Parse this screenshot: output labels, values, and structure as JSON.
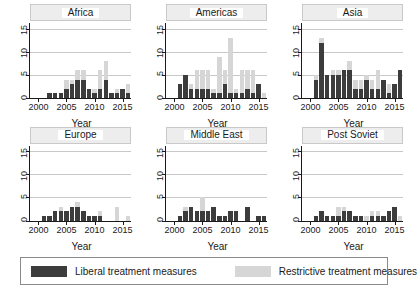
{
  "chart_data": {
    "type": "bar",
    "title": "",
    "subtitle": "",
    "xlabel": "Year",
    "ylabel": "",
    "stacked": true,
    "grid": true,
    "legend_position": "bottom",
    "ylim": [
      0,
      16.5
    ],
    "yticks": [
      0,
      5,
      10,
      15
    ],
    "ytick_labels": [
      "0",
      "5",
      "10",
      "15"
    ],
    "xticks": [
      2000,
      2005,
      2010,
      2015
    ],
    "xtick_labels": [
      "2000",
      "2005",
      "2010",
      "2015"
    ],
    "xlim": [
      1998.5,
      2016.5
    ],
    "x": [
      2000,
      2001,
      2002,
      2003,
      2004,
      2005,
      2006,
      2007,
      2008,
      2009,
      2010,
      2011,
      2012,
      2013,
      2014,
      2015,
      2016
    ],
    "series_names": [
      "Liberal treatment measures",
      "Restrictive treatment measures"
    ],
    "colors": {
      "liberal": "#3c3c3c",
      "restrictive": "#d6d6d6",
      "gridline": "#c8c8c8",
      "axis": "#1a1a1a",
      "strip_background": "#ededed",
      "background": "#ffffff"
    },
    "panels": [
      {
        "name": "Africa",
        "series": [
          {
            "name": "Liberal treatment measures",
            "values": [
              0,
              0,
              1,
              1,
              1,
              2,
              3,
              4,
              4,
              2,
              1,
              2,
              4,
              1,
              1,
              2,
              1,
              2,
              0
            ]
          },
          {
            "name": "Restrictive treatment measures",
            "values": [
              0,
              0,
              0,
              0,
              0,
              2,
              1,
              2,
              2,
              0,
              1,
              4,
              4,
              0,
              1,
              0,
              2,
              0,
              0
            ]
          }
        ]
      },
      {
        "name": "Americas",
        "series": [
          {
            "name": "Liberal treatment measures",
            "values": [
              0,
              3,
              5,
              2,
              2,
              2,
              2,
              1,
              1,
              3,
              1,
              1,
              1,
              2,
              1,
              3,
              0
            ]
          },
          {
            "name": "Restrictive treatment measures",
            "values": [
              0,
              0,
              0,
              1,
              4,
              4,
              4,
              1,
              8,
              3,
              12,
              1,
              5,
              4,
              5,
              0,
              1
            ]
          }
        ]
      },
      {
        "name": "Asia",
        "series": [
          {
            "name": "Liberal treatment measures",
            "values": [
              0,
              4,
              12,
              5,
              5,
              5,
              6,
              6,
              2,
              2,
              4,
              2,
              2,
              4,
              1,
              3,
              6
            ]
          },
          {
            "name": "Restrictive treatment measures",
            "values": [
              0,
              1,
              1,
              0,
              1,
              1,
              0,
              2,
              2,
              2,
              1,
              2,
              4,
              0,
              2,
              0,
              0
            ]
          }
        ]
      },
      {
        "name": "Europe",
        "series": [
          {
            "name": "Liberal treatment measures",
            "values": [
              0,
              1,
              1,
              2,
              2,
              2,
              3,
              3,
              2,
              1,
              1,
              1,
              0,
              0,
              0,
              0,
              0
            ]
          },
          {
            "name": "Restrictive treatment measures",
            "values": [
              0,
              0,
              0,
              0,
              1,
              0,
              0,
              1,
              0,
              0,
              0,
              1,
              0,
              0,
              3,
              0,
              1
            ]
          }
        ]
      },
      {
        "name": "Middle East",
        "series": [
          {
            "name": "Liberal treatment measures",
            "values": [
              0,
              1,
              2,
              3,
              2,
              2,
              2,
              3,
              1,
              1,
              2,
              2,
              0,
              3,
              0,
              1,
              1
            ]
          },
          {
            "name": "Restrictive treatment measures",
            "values": [
              0,
              0,
              1,
              0,
              0,
              3,
              0,
              0,
              0,
              0,
              0,
              0,
              0,
              0,
              0,
              0,
              0
            ]
          }
        ]
      },
      {
        "name": "Post Soviet",
        "series": [
          {
            "name": "Liberal treatment measures",
            "values": [
              0,
              1,
              2,
              1,
              1,
              1,
              2,
              2,
              1,
              1,
              0,
              1,
              1,
              1,
              2,
              3,
              0
            ]
          },
          {
            "name": "Restrictive treatment measures",
            "values": [
              0,
              0,
              0,
              0,
              0,
              2,
              1,
              0,
              0,
              0,
              1,
              1,
              1,
              0,
              0,
              0,
              1
            ]
          }
        ]
      }
    ]
  },
  "legend": {
    "items": [
      {
        "label": "Liberal treatment measures",
        "color": "#3c3c3c"
      },
      {
        "label": "Restrictive treatment measures",
        "color": "#d6d6d6"
      }
    ]
  }
}
